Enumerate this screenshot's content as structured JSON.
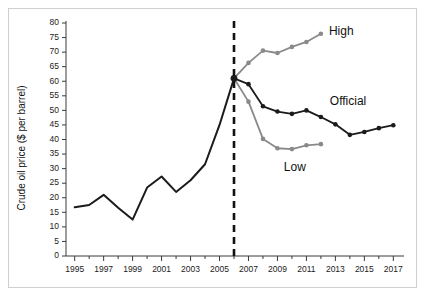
{
  "figure": {
    "cropped_title": "",
    "frame_border_color": "#cfcfcf",
    "background_color": "#ffffff"
  },
  "axes": {
    "y_title": "Crude oil price ($ per barrel)",
    "x_title": "",
    "y_ticks": [
      "0",
      "5",
      "10",
      "15",
      "20",
      "25",
      "30",
      "35",
      "40",
      "45",
      "50",
      "55",
      "60",
      "65",
      "70",
      "75",
      "80"
    ],
    "x_ticks": [
      "1995",
      "1997",
      "1999",
      "2001",
      "2003",
      "2005",
      "2007",
      "2009",
      "2011",
      "2013",
      "2015",
      "2017"
    ]
  },
  "annotations": {
    "high_label": "High",
    "official_label": "Official",
    "low_label": "Low"
  },
  "colors": {
    "historical": "#1b1b1b",
    "official": "#1b1b1b",
    "high": "#8a8a8a",
    "low": "#8a8a8a",
    "divider": "#111111",
    "axis": "#3a3a3a"
  },
  "chart_data": {
    "type": "line",
    "title": "",
    "xlabel": "",
    "ylabel": "Crude oil price ($ per barrel)",
    "xlim": [
      1994.4,
      2017.6
    ],
    "ylim": [
      0,
      80
    ],
    "y_tick_step": 5,
    "x_tick_step": 2,
    "x_minor_ticks": true,
    "grid": false,
    "legend": "inline-annotations",
    "divider_line": {
      "x": 2006,
      "style": "dashed",
      "label": ""
    },
    "series": [
      {
        "name": "Historical",
        "color": "#1b1b1b",
        "markers": false,
        "x": [
          1995,
          1996,
          1997,
          1998,
          1999,
          2000,
          2001,
          2002,
          2003,
          2004,
          2005,
          2006
        ],
        "values": [
          16.7,
          17.5,
          21.0,
          16.6,
          12.5,
          23.5,
          27.3,
          22.0,
          26.0,
          31.5,
          45.0,
          61.0
        ]
      },
      {
        "name": "High",
        "color": "#8a8a8a",
        "markers": true,
        "x": [
          2006,
          2007,
          2008,
          2009,
          2010,
          2011,
          2012
        ],
        "values": [
          61.0,
          66.3,
          70.5,
          69.7,
          71.8,
          73.5,
          76.3
        ]
      },
      {
        "name": "Official",
        "color": "#1b1b1b",
        "markers": true,
        "x": [
          2006,
          2007,
          2008,
          2009,
          2010,
          2011,
          2012,
          2013,
          2014,
          2015,
          2016,
          2017
        ],
        "values": [
          61.0,
          59.0,
          51.4,
          49.6,
          48.8,
          50.0,
          47.7,
          45.2,
          41.6,
          42.6,
          43.9,
          44.9
        ]
      },
      {
        "name": "Low",
        "color": "#8a8a8a",
        "markers": true,
        "x": [
          2006,
          2007,
          2008,
          2009,
          2010,
          2011,
          2012
        ],
        "values": [
          61.0,
          53.0,
          40.2,
          37.0,
          36.7,
          38.0,
          38.4
        ]
      }
    ]
  }
}
